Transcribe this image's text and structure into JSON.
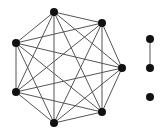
{
  "diagram": {
    "type": "graph",
    "background": "#ffffff",
    "edge_color": "#555555",
    "node_color": "#111111",
    "node_radius": 4,
    "edge_width": 1,
    "components": [
      {
        "name": "complete-graph-K7",
        "nodes": [
          {
            "id": "a",
            "x": 54,
            "y": 12
          },
          {
            "id": "b",
            "x": 102,
            "y": 23
          },
          {
            "id": "c",
            "x": 122,
            "y": 68
          },
          {
            "id": "d",
            "x": 102,
            "y": 112
          },
          {
            "id": "e",
            "x": 54,
            "y": 123
          },
          {
            "id": "f",
            "x": 16,
            "y": 92
          },
          {
            "id": "g",
            "x": 16,
            "y": 43
          }
        ],
        "edges": [
          [
            "a",
            "b"
          ],
          [
            "a",
            "c"
          ],
          [
            "a",
            "d"
          ],
          [
            "a",
            "e"
          ],
          [
            "a",
            "f"
          ],
          [
            "a",
            "g"
          ],
          [
            "b",
            "c"
          ],
          [
            "b",
            "d"
          ],
          [
            "b",
            "e"
          ],
          [
            "b",
            "f"
          ],
          [
            "b",
            "g"
          ],
          [
            "c",
            "d"
          ],
          [
            "c",
            "e"
          ],
          [
            "c",
            "f"
          ],
          [
            "c",
            "g"
          ],
          [
            "d",
            "e"
          ],
          [
            "d",
            "f"
          ],
          [
            "d",
            "g"
          ],
          [
            "e",
            "f"
          ],
          [
            "e",
            "g"
          ],
          [
            "f",
            "g"
          ]
        ]
      },
      {
        "name": "single-edge",
        "nodes": [
          {
            "id": "h",
            "x": 150,
            "y": 39
          },
          {
            "id": "i",
            "x": 150,
            "y": 68
          }
        ],
        "edges": [
          [
            "h",
            "i"
          ]
        ]
      },
      {
        "name": "isolated-node",
        "nodes": [
          {
            "id": "j",
            "x": 150,
            "y": 97
          }
        ],
        "edges": []
      }
    ]
  }
}
